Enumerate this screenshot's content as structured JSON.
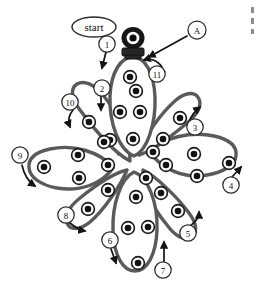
{
  "figure": {
    "title_label": "start",
    "marker_label": "A",
    "colors": {
      "petal_stroke": "#5a5a5a",
      "node_core": "#121212",
      "node_ring_stroke": "#1a1a1a",
      "arrow": "#141414",
      "background": "#ffffff",
      "cap_dark": "#171717",
      "cap_band": "#262626"
    }
  },
  "labels": {
    "start": "start",
    "marker_a": "A"
  },
  "steps": [
    {
      "id": "1",
      "label": "1",
      "x": 107,
      "y": 44,
      "arrow": "down-left"
    },
    {
      "id": "2",
      "label": "2",
      "x": 102,
      "y": 88,
      "arrow": "down"
    },
    {
      "id": "3",
      "label": "3",
      "x": 195,
      "y": 127,
      "arrow": "up-right"
    },
    {
      "id": "4",
      "label": "4",
      "x": 231,
      "y": 185,
      "arrow": "up-right"
    },
    {
      "id": "5",
      "label": "5",
      "x": 188,
      "y": 233,
      "arrow": "up-right"
    },
    {
      "id": "6",
      "label": "6",
      "x": 110,
      "y": 240,
      "arrow": "down"
    },
    {
      "id": "7",
      "label": "7",
      "x": 163,
      "y": 270,
      "arrow": "up"
    },
    {
      "id": "8",
      "label": "8",
      "x": 66,
      "y": 215,
      "arrow": "down-right"
    },
    {
      "id": "9",
      "label": "9",
      "x": 20,
      "y": 155,
      "arrow": "down"
    },
    {
      "id": "10",
      "label": "10",
      "x": 70,
      "y": 102,
      "arrow": "down-left"
    },
    {
      "id": "11",
      "label": "11",
      "x": 157,
      "y": 74,
      "arrow": "up-left"
    }
  ],
  "petals": [
    {
      "name": "north",
      "node_count": 6
    },
    {
      "name": "northeast",
      "node_count": 3
    },
    {
      "name": "east",
      "node_count": 4
    },
    {
      "name": "southeast",
      "node_count": 3
    },
    {
      "name": "south",
      "node_count": 6
    },
    {
      "name": "southwest",
      "node_count": 3
    },
    {
      "name": "west",
      "node_count": 4
    },
    {
      "name": "northwest",
      "node_count": 3
    }
  ],
  "nodes": {
    "total_count": 32,
    "ring_radius": 6.2,
    "core_radius": 3.2
  }
}
